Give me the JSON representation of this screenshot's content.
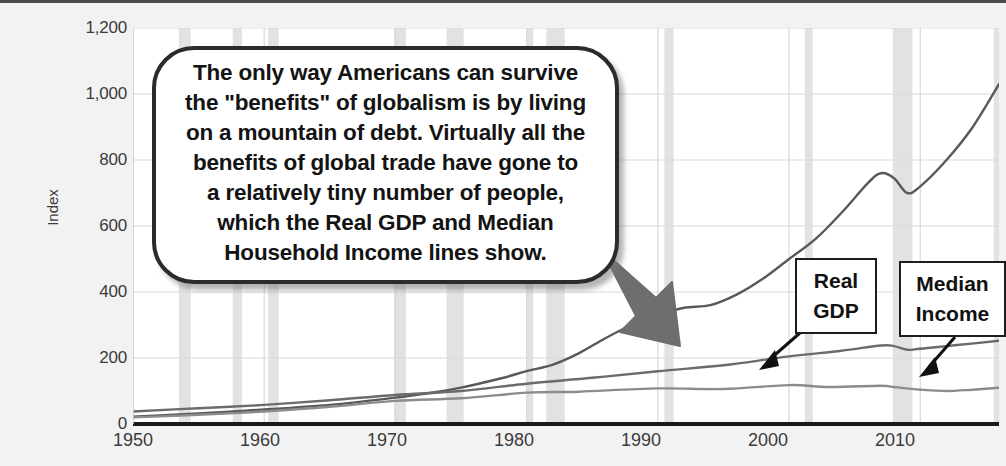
{
  "chart_data": {
    "type": "line",
    "title": "",
    "xlabel": "",
    "ylabel": "Index",
    "xlim": [
      1950,
      2016
    ],
    "ylim": [
      0,
      1200
    ],
    "grid": true,
    "legend_position": "annotations",
    "x_ticks": [
      "1950",
      "1960",
      "1970",
      "1980",
      "1990",
      "2000",
      "2010"
    ],
    "y_ticks": [
      "0",
      "200",
      "400",
      "600",
      "800",
      "1,000",
      "1,200"
    ],
    "series": [
      {
        "name": "Total Debt",
        "color": "#595959",
        "x": [
          1950,
          1955,
          1960,
          1965,
          1970,
          1973,
          1975,
          1978,
          1980,
          1982,
          1984,
          1986,
          1988,
          1990,
          1992,
          1994,
          1996,
          1998,
          2000,
          2002,
          2004,
          2006,
          2007,
          2008,
          2009,
          2010,
          2012,
          2014,
          2016
        ],
        "values": [
          22,
          32,
          44,
          58,
          80,
          96,
          110,
          138,
          160,
          180,
          215,
          260,
          300,
          330,
          352,
          360,
          392,
          440,
          500,
          560,
          640,
          730,
          760,
          745,
          700,
          720,
          800,
          900,
          1030
        ]
      },
      {
        "name": "Real GDP",
        "color": "#6b6b6b",
        "x": [
          1950,
          1955,
          1960,
          1965,
          1970,
          1975,
          1980,
          1985,
          1990,
          1995,
          2000,
          2004,
          2007,
          2008,
          2009,
          2010,
          2013,
          2016
        ],
        "values": [
          38,
          48,
          58,
          72,
          88,
          100,
          122,
          140,
          160,
          178,
          205,
          222,
          238,
          236,
          225,
          228,
          240,
          252
        ]
      },
      {
        "name": "Median Household Income",
        "color": "#8c8c8c",
        "x": [
          1950,
          1955,
          1960,
          1965,
          1970,
          1975,
          1980,
          1984,
          1990,
          1995,
          2000,
          2003,
          2007,
          2008,
          2010,
          2012,
          2014,
          2016
        ],
        "values": [
          20,
          28,
          38,
          52,
          70,
          78,
          95,
          98,
          108,
          106,
          118,
          112,
          116,
          112,
          104,
          100,
          104,
          110
        ]
      }
    ],
    "recession_bands": [
      [
        1953.5,
        1954.4
      ],
      [
        1957.6,
        1958.3
      ],
      [
        1960.3,
        1961.1
      ],
      [
        1969.9,
        1970.8
      ],
      [
        1973.9,
        1975.2
      ],
      [
        1980.0,
        1980.5
      ],
      [
        1981.5,
        1982.9
      ],
      [
        1990.5,
        1991.2
      ],
      [
        2001.2,
        2001.8
      ],
      [
        2007.9,
        2009.4
      ],
      [
        2015.6,
        2016.2
      ]
    ],
    "annotations": [
      {
        "name": "Real GDP",
        "lines": [
          "Real",
          "GDP"
        ]
      },
      {
        "name": "Median Income",
        "lines": [
          "Median",
          "Income"
        ]
      }
    ]
  },
  "axis": {
    "y_title": "Index",
    "y_ticks": [
      "1,200",
      "1,000",
      "800",
      "600",
      "400",
      "200",
      "0"
    ],
    "x_ticks": [
      "1950",
      "1960",
      "1970",
      "1980",
      "1990",
      "2000",
      "2010"
    ]
  },
  "callout": {
    "text": "The only way Americans can survive\nthe \"benefits\" of globalism is by living\non a mountain of debt. Virtually all the\nbenefits of global trade have gone to\na relatively tiny number of people,\nwhich the Real GDP and Median\nHousehold Income lines show."
  },
  "labels": {
    "gdp_line1": "Real",
    "gdp_line2": "GDP",
    "income_line1": "Median",
    "income_line2": "Income"
  },
  "colors": {
    "background": "#f2f2f2",
    "plot_background": "#ffffff",
    "gridline": "#d9d9d9",
    "recession_band": "#e2e2e2",
    "axis_line": "#1a1a1a",
    "debt_line": "#595959",
    "gdp_line": "#6b6b6b",
    "income_line": "#8c8c8c",
    "callout_border": "#2b2b2b",
    "arrow": "#6e6e6e"
  }
}
